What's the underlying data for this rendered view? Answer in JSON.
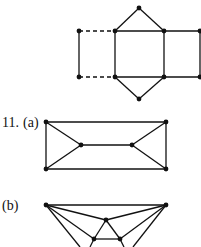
{
  "colors": {
    "ink": "#111111",
    "background": "#ffffff"
  },
  "labels": {
    "problem": "11.",
    "part_a": "(a)",
    "part_b": "(b)"
  },
  "graphs": {
    "top": {
      "nodes": [
        [
          139,
          8
        ],
        [
          79,
          31
        ],
        [
          115,
          31
        ],
        [
          164,
          31
        ],
        [
          200,
          31
        ],
        [
          79,
          77
        ],
        [
          115,
          77
        ],
        [
          164,
          77
        ],
        [
          200,
          77
        ],
        [
          139,
          99
        ]
      ],
      "solid_edges": [
        [
          0,
          2
        ],
        [
          0,
          3
        ],
        [
          2,
          3
        ],
        [
          3,
          4
        ],
        [
          4,
          8
        ],
        [
          1,
          5
        ],
        [
          2,
          6
        ],
        [
          3,
          7
        ],
        [
          6,
          7
        ],
        [
          7,
          8
        ],
        [
          6,
          9
        ],
        [
          7,
          9
        ]
      ],
      "dashed_edges": [
        [
          1,
          2
        ],
        [
          5,
          6
        ]
      ]
    },
    "a": {
      "nodes": [
        [
          46,
          122
        ],
        [
          166,
          122
        ],
        [
          46,
          169
        ],
        [
          166,
          169
        ],
        [
          81,
          145
        ],
        [
          132,
          145
        ]
      ],
      "edges": [
        [
          0,
          1
        ],
        [
          0,
          2
        ],
        [
          1,
          3
        ],
        [
          2,
          3
        ],
        [
          0,
          4
        ],
        [
          2,
          4
        ],
        [
          4,
          5
        ],
        [
          1,
          5
        ],
        [
          3,
          5
        ]
      ]
    },
    "b": {
      "nodes": [
        [
          46,
          205
        ],
        [
          166,
          205
        ],
        [
          106,
          220
        ],
        [
          94,
          239
        ],
        [
          120,
          239
        ]
      ],
      "edges": [
        [
          0,
          1
        ],
        [
          0,
          2
        ],
        [
          1,
          2
        ],
        [
          2,
          3
        ],
        [
          2,
          4
        ],
        [
          3,
          4
        ],
        [
          0,
          3
        ],
        [
          1,
          4
        ]
      ],
      "open_edges": [
        [
          [
            46,
            205
          ],
          [
            80,
            247
          ]
        ],
        [
          [
            166,
            205
          ],
          [
            133,
            247
          ]
        ],
        [
          [
            94,
            239
          ],
          [
            90,
            247
          ]
        ],
        [
          [
            120,
            239
          ],
          [
            124,
            247
          ]
        ]
      ]
    }
  }
}
